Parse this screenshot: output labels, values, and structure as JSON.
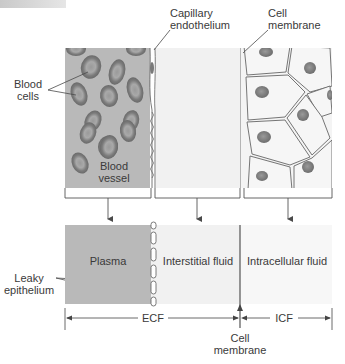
{
  "diagram": {
    "top_panel": {
      "labels": {
        "capillary_endothelium": [
          "Capillary",
          "endothelium"
        ],
        "cell_membrane": [
          "Cell",
          "membrane"
        ],
        "blood_cells": [
          "Blood",
          "cells"
        ],
        "blood_vessel": [
          "Blood",
          "vessel"
        ]
      }
    },
    "bottom_panel": {
      "compartments": [
        {
          "name": "plasma",
          "label": "Plasma"
        },
        {
          "name": "interstitial",
          "label": "Interstitial fluid"
        },
        {
          "name": "intracellular",
          "label": "Intracellular fluid"
        }
      ],
      "leaky_epithelium": [
        "Leaky",
        "epithelium"
      ]
    },
    "axis": {
      "ecf": "ECF",
      "icf": "ICF",
      "cell_membrane": [
        "Cell",
        "membrane"
      ]
    },
    "colors": {
      "plasma": "#b9b9b9",
      "interstitial": "#f1f1f1",
      "intracellular": "#f6f6f6",
      "rbc": "#8a8a8a",
      "rbc_center": "#a5a5a5",
      "line": "#4a4a4a"
    }
  }
}
